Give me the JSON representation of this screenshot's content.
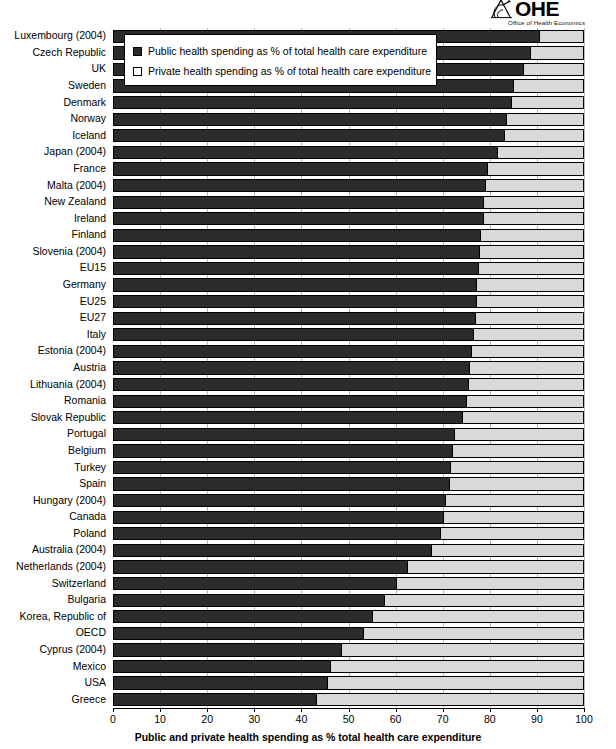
{
  "logo": {
    "mark_name": "ohe-logo-mark",
    "wordmark": "OHE",
    "subtitle": "Office of Health Economics"
  },
  "legend": {
    "position": "top-left-inside",
    "items": [
      {
        "swatch": "public",
        "label": "Public health spending as % of total health care expenditure"
      },
      {
        "swatch": "private",
        "label": "Private health spending as % of total health care expenditure"
      }
    ]
  },
  "axis": {
    "x_title": "Public and private health spending as % total health care expenditure",
    "x_ticks": [
      "0",
      "10",
      "20",
      "30",
      "40",
      "50",
      "60",
      "70",
      "80",
      "90",
      "100"
    ]
  },
  "colors": {
    "public": "#2b2b2b",
    "private": "#d9d9d9",
    "grid": "#b9b9b9",
    "axis": "#000000",
    "background": "#ffffff"
  },
  "chart_data": {
    "type": "bar",
    "orientation": "horizontal",
    "stacked": true,
    "stack_total": 100,
    "title": "",
    "xlabel": "Public and private health spending as % total health care expenditure",
    "ylabel": "",
    "xlim": [
      0,
      100
    ],
    "xtick_step": 10,
    "grid": true,
    "legend_position": "top-left-inside",
    "categories": [
      "Luxembourg (2004)",
      "Czech Republic",
      "UK",
      "Sweden",
      "Denmark",
      "Norway",
      "Iceland",
      "Japan (2004)",
      "France",
      "Malta (2004)",
      "New Zealand",
      "Ireland",
      "Finland",
      "Slovenia (2004)",
      "EU15",
      "Germany",
      "EU25",
      "EU27",
      "Italy",
      "Estonia (2004)",
      "Austria",
      "Lithuania (2004)",
      "Romania",
      "Slovak Republic",
      "Portugal",
      "Belgium",
      "Turkey",
      "Spain",
      "Hungary (2004)",
      "Canada",
      "Poland",
      "Australia (2004)",
      "Netherlands (2004)",
      "Switzerland",
      "Bulgaria",
      "Korea, Republic of",
      "OECD",
      "Cyprus (2004)",
      "Mexico",
      "USA",
      "Greece"
    ],
    "series": [
      {
        "name": "Public health spending as % of total health care expenditure",
        "color": "#2b2b2b",
        "values": [
          90.5,
          88.5,
          87.0,
          85.0,
          84.5,
          83.5,
          83.0,
          81.5,
          79.5,
          79.0,
          78.5,
          78.5,
          78.0,
          77.8,
          77.5,
          77.0,
          77.0,
          76.8,
          76.5,
          76.0,
          75.5,
          75.3,
          75.0,
          74.0,
          72.5,
          72.0,
          71.5,
          71.3,
          70.5,
          70.0,
          69.5,
          67.5,
          62.5,
          60.0,
          57.5,
          55.0,
          53.0,
          48.5,
          46.0,
          45.5,
          43.0
        ]
      },
      {
        "name": "Private health spending as % of total health care expenditure",
        "color": "#d9d9d9",
        "values": [
          9.5,
          11.5,
          13.0,
          15.0,
          15.5,
          16.5,
          17.0,
          18.5,
          20.5,
          21.0,
          21.5,
          21.5,
          22.0,
          22.2,
          22.5,
          23.0,
          23.0,
          23.2,
          23.5,
          24.0,
          24.5,
          24.7,
          25.0,
          26.0,
          27.5,
          28.0,
          28.5,
          28.7,
          29.5,
          30.0,
          30.5,
          32.5,
          37.5,
          40.0,
          42.5,
          45.0,
          47.0,
          51.5,
          54.0,
          54.5,
          57.0
        ]
      }
    ]
  }
}
